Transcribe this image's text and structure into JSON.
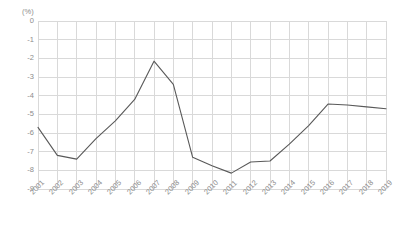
{
  "chart_data": {
    "type": "line",
    "title": "",
    "subtitle": "",
    "xlabel": "",
    "ylabel": "(%)",
    "unit_label": "(%)",
    "categories": [
      "2001",
      "2002",
      "2003",
      "2004",
      "2005",
      "2006",
      "2007",
      "2008",
      "2009",
      "2010",
      "2011",
      "2012",
      "2013",
      "2014",
      "2015",
      "2016",
      "2017",
      "2018",
      "2019"
    ],
    "values": [
      -5.7,
      -7.2,
      -7.4,
      -6.3,
      -5.35,
      -4.2,
      -2.15,
      -3.4,
      -7.3,
      -7.75,
      -8.15,
      -7.55,
      -7.5,
      -6.6,
      -5.6,
      -4.45,
      -4.5,
      -4.6,
      -4.7
    ],
    "series": [
      {
        "name": "",
        "values": [
          -5.7,
          -7.2,
          -7.4,
          -6.3,
          -5.35,
          -4.2,
          -2.15,
          -3.4,
          -7.3,
          -7.75,
          -8.15,
          -7.55,
          -7.5,
          -6.6,
          -5.6,
          -4.45,
          -4.5,
          -4.6,
          -4.7
        ]
      }
    ],
    "ylim": [
      -9,
      0
    ],
    "yticks": [
      0,
      -1,
      -2,
      -3,
      -4,
      -5,
      -6,
      -7,
      -8,
      -9
    ],
    "ytick_labels": [
      "0",
      "-1",
      "-2",
      "-3",
      "-4",
      "-5",
      "-6",
      "-7",
      "-8",
      "-9"
    ],
    "grid": true,
    "grid_x": true,
    "grid_y": true,
    "legend": false,
    "legend_position": "none",
    "line_color": "#595959",
    "grid_color": "#d9d9d9",
    "axis_color": "#bfbfbf",
    "text_color": "#8c8c8c",
    "background_color": "#ffffff",
    "markers": false,
    "line_width": 1.1
  }
}
